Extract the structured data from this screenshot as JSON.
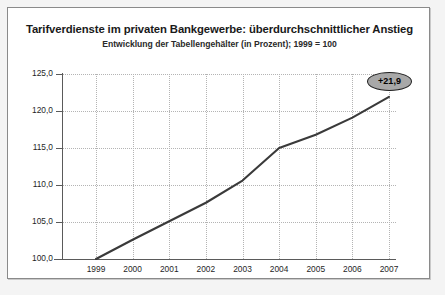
{
  "chart_data": {
    "type": "line",
    "title": "Tarifverdienste im privaten Bankgewerbe: überdurchschnittlicher Anstieg",
    "subtitle": "Entwicklung der Tabellengehälter (in Prozent); 1999 = 100",
    "xlabel": "",
    "ylabel": "",
    "categories": [
      "1999",
      "2000",
      "2001",
      "2002",
      "2003",
      "2004",
      "2005",
      "2006",
      "2007"
    ],
    "values": [
      100.0,
      102.6,
      105.1,
      107.6,
      110.6,
      115.0,
      116.8,
      119.1,
      121.9
    ],
    "ylim": [
      100.0,
      125.0
    ],
    "ytick_labels": [
      "100,0",
      "105,0",
      "110,0",
      "115,0",
      "120,0",
      "125,0"
    ],
    "ytick_values": [
      100.0,
      105.0,
      110.0,
      115.0,
      120.0,
      125.0
    ],
    "grid": true,
    "legend": "none",
    "annotations": [
      {
        "text": "+21,9",
        "category": "2007",
        "value": 121.9
      }
    ],
    "colors": {
      "line": "#3a3a3a",
      "grid": "#b4b4b4",
      "axis": "#5a5a5a",
      "badge_fill": "#a8a8a8",
      "badge_border": "#1f1f1f",
      "frame": "#8a8a8a",
      "background": "#ffffff",
      "page_background": "#f4f4f4"
    }
  }
}
